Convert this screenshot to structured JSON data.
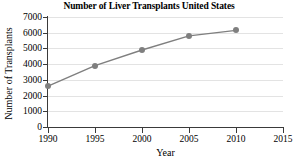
{
  "chart_data": {
    "type": "line",
    "title": "Number of Liver Transplants United States",
    "xlabel": "Year",
    "ylabel": "Number of Transplants",
    "x": [
      1990,
      1995,
      2000,
      2005,
      2010
    ],
    "values": [
      2600,
      3900,
      4900,
      5800,
      6150
    ],
    "series": [
      {
        "name": "Liver transplants",
        "x": [
          1990,
          1995,
          2000,
          2005,
          2010
        ],
        "values": [
          2600,
          3900,
          4900,
          5800,
          6150
        ]
      }
    ],
    "xlim": [
      1990,
      2015
    ],
    "ylim": [
      0,
      7000
    ],
    "xticks": [
      "1990",
      "1995",
      "2000",
      "2005",
      "2010",
      "2015"
    ],
    "yticks": [
      "0",
      "1000",
      "2000",
      "3000",
      "4000",
      "5000",
      "6000",
      "7000"
    ],
    "grid": "horizontal",
    "legend": "none",
    "line_color": "#7f7f7f",
    "marker_color": "#7f7f7f",
    "marker": "circle",
    "grid_color": "#e3e3e3",
    "axis_color": "#3a3a3a",
    "text_color": "#000000",
    "background": "#ffffff"
  }
}
